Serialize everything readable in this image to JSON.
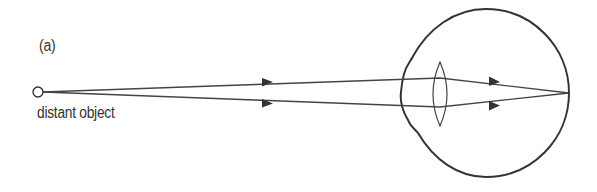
{
  "figure": {
    "panel_label": "(a)",
    "object_label": "distant object",
    "colors": {
      "stroke": "#333333",
      "text": "#333333",
      "background": "#ffffff"
    },
    "elements": {
      "object_point": {
        "cx": 38,
        "cy": 92,
        "r": 5
      },
      "rays": [
        {
          "name": "upper-ray",
          "points": [
            [
              43,
              92
            ],
            [
              440,
              78
            ],
            [
              569,
              93
            ]
          ],
          "arrows": [
            [
              268,
              82
            ],
            [
              495,
              81
            ]
          ]
        },
        {
          "name": "lower-ray",
          "points": [
            [
              43,
              92
            ],
            [
              440,
              107
            ],
            [
              569,
              93
            ]
          ],
          "arrows": [
            [
              268,
              103
            ],
            [
              495,
              106
            ]
          ]
        }
      ],
      "eyeball": {
        "cx": 486,
        "cy": 93,
        "r": 84
      },
      "lens": {
        "cx": 440,
        "top": 62,
        "bottom": 126,
        "half_width": 7
      },
      "focal_point": {
        "x": 569,
        "y": 93
      }
    }
  }
}
